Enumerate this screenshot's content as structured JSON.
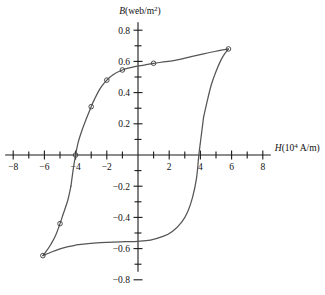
{
  "chart_data": {
    "type": "line",
    "title": "",
    "subtitle": "",
    "xlabel": "H(10⁴ A/m)",
    "ylabel": "B(web/m²)",
    "xlim": [
      -8,
      8
    ],
    "ylim": [
      -0.8,
      0.8
    ],
    "grid": false,
    "legend": "none",
    "x_tick_labels": [
      "-8",
      "-6",
      "-4",
      "-2",
      "2",
      "4",
      "6",
      "8"
    ],
    "x_tick_values": [
      -8,
      -6,
      -4,
      -2,
      2,
      4,
      6,
      8
    ],
    "x_minor_tick_values": [
      -7,
      -5,
      -3,
      -1,
      1,
      3,
      5,
      7
    ],
    "y_tick_labels": [
      "0.8",
      "0.6",
      "0.4",
      "0.2",
      "-0.2",
      "-0.4",
      "-0.6",
      "-0.8"
    ],
    "y_tick_values": [
      0.8,
      0.6,
      0.4,
      0.2,
      -0.2,
      -0.4,
      -0.6,
      -0.8
    ],
    "y_minor_tick_values": [
      0.7,
      0.5,
      0.3,
      0.1,
      -0.1,
      -0.3,
      -0.5,
      -0.7
    ],
    "annotations": {
      "coercivity_negative": -4.0,
      "coercivity_positive": 3.9,
      "remanence_positive": 0.56,
      "remanence_negative": -0.55,
      "saturation_positive": 0.68,
      "saturation_negative": -0.645
    },
    "series": [
      {
        "name": "upper-branch",
        "description": "Descending branch of hysteresis loop, from positive saturation leftward through negative coercivity",
        "x": [
          5.8,
          5.0,
          4.2,
          3.4,
          2.6,
          1.8,
          1.0,
          0.3,
          -0.4,
          -1.0,
          -1.6,
          -2.0,
          -2.4,
          -2.8,
          -3.0,
          -3.3,
          -3.6,
          -3.85,
          -4.0,
          -4.15,
          -4.3
        ],
        "y": [
          0.68,
          0.665,
          0.648,
          0.63,
          0.612,
          0.598,
          0.588,
          0.575,
          0.562,
          0.545,
          0.515,
          0.48,
          0.43,
          0.355,
          0.31,
          0.235,
          0.155,
          0.075,
          0.0,
          -0.09,
          -0.2
        ]
      },
      {
        "name": "lower-branch",
        "description": "Ascending branch of hysteresis loop, from negative saturation rightward through positive coercivity",
        "x": [
          -6.1,
          -5.5,
          -5.0,
          -4.6,
          -4.2,
          -3.8,
          -3.2,
          -2.4,
          -1.6,
          -0.8,
          0.0,
          0.8,
          1.6,
          2.2,
          2.8,
          3.2,
          3.5,
          3.75,
          3.9,
          4.05,
          4.2
        ],
        "y": [
          -0.645,
          -0.62,
          -0.602,
          -0.59,
          -0.582,
          -0.575,
          -0.568,
          -0.562,
          -0.558,
          -0.556,
          -0.553,
          -0.545,
          -0.522,
          -0.49,
          -0.43,
          -0.36,
          -0.27,
          -0.15,
          0.0,
          0.12,
          0.24
        ]
      },
      {
        "name": "upper-branch-tail",
        "description": "Continuation of descending branch down to negative saturation",
        "x": [
          -4.3,
          -4.5,
          -4.8,
          -5.0,
          -5.3,
          -5.6,
          -5.9,
          -6.1
        ],
        "y": [
          -0.2,
          -0.29,
          -0.38,
          -0.44,
          -0.52,
          -0.575,
          -0.62,
          -0.645
        ]
      },
      {
        "name": "lower-branch-tail",
        "description": "Continuation of ascending branch up to positive saturation",
        "x": [
          4.2,
          4.4,
          4.7,
          5.0,
          5.3,
          5.55,
          5.8
        ],
        "y": [
          0.24,
          0.33,
          0.45,
          0.535,
          0.605,
          0.648,
          0.68
        ]
      }
    ],
    "data_point_markers": [
      {
        "x": 5.8,
        "y": 0.68
      },
      {
        "x": 1.0,
        "y": 0.588
      },
      {
        "x": -1.0,
        "y": 0.545
      },
      {
        "x": -2.0,
        "y": 0.48
      },
      {
        "x": -3.0,
        "y": 0.31
      },
      {
        "x": -4.0,
        "y": 0.0
      },
      {
        "x": -5.0,
        "y": -0.44
      },
      {
        "x": -6.1,
        "y": -0.645
      }
    ]
  }
}
